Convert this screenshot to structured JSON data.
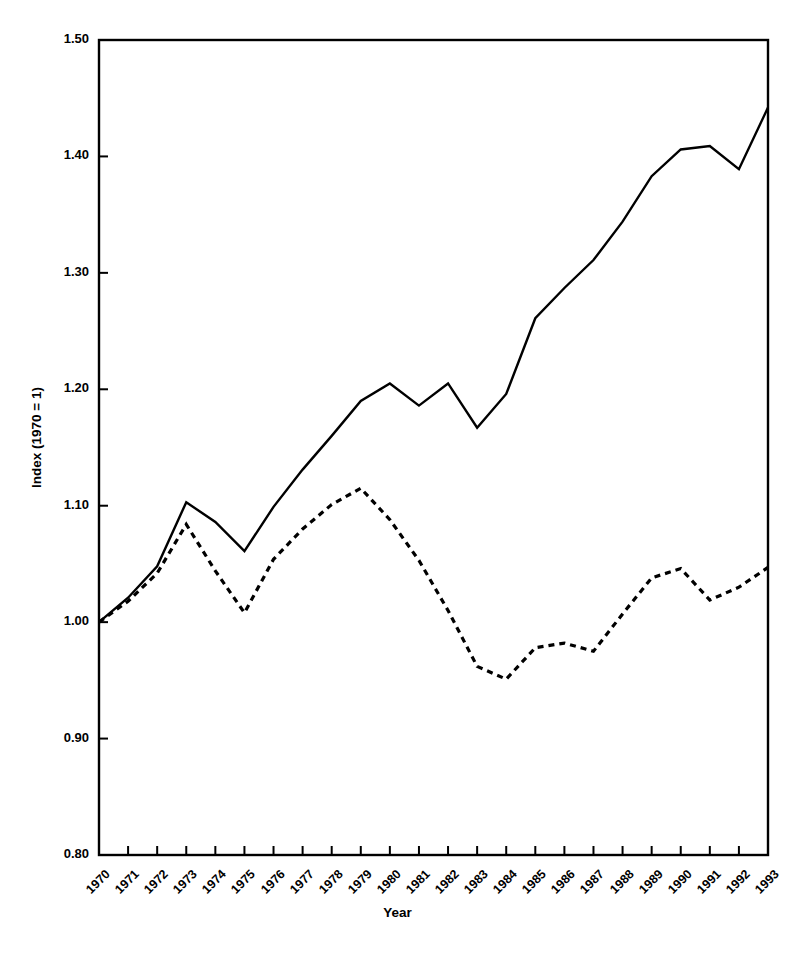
{
  "chart_data": {
    "type": "line",
    "title": "",
    "xlabel": "Year",
    "ylabel": "Index (1970 = 1)",
    "x": [
      1970,
      1971,
      1972,
      1973,
      1974,
      1975,
      1976,
      1977,
      1978,
      1979,
      1980,
      1981,
      1982,
      1983,
      1984,
      1985,
      1986,
      1987,
      1988,
      1989,
      1990,
      1991,
      1992,
      1993
    ],
    "xtick_labels": [
      "1970",
      "1971",
      "1972",
      "1973",
      "1974",
      "1975",
      "1976",
      "1977",
      "1978",
      "1979",
      "1980",
      "1981",
      "1982",
      "1983",
      "1984",
      "1985",
      "1986",
      "1987",
      "1988",
      "1989",
      "1990",
      "1991",
      "1992",
      "1993"
    ],
    "ytick_labels": [
      "0.80",
      "0.90",
      "1.00",
      "1.10",
      "1.20",
      "1.30",
      "1.40",
      "1.50"
    ],
    "ytick_values": [
      0.8,
      0.9,
      1.0,
      1.1,
      1.2,
      1.3,
      1.4,
      1.5
    ],
    "ylim": [
      0.8,
      1.5
    ],
    "xlim": [
      1970,
      1993
    ],
    "grid": false,
    "legend_position": "none",
    "series": [
      {
        "name": "solid-series",
        "style": "solid",
        "color": "#000000",
        "values": [
          1.0,
          1.021,
          1.048,
          1.103,
          1.086,
          1.061,
          1.099,
          1.131,
          1.16,
          1.19,
          1.205,
          1.186,
          1.205,
          1.167,
          1.196,
          1.261,
          1.287,
          1.311,
          1.344,
          1.383,
          1.406,
          1.409,
          1.389,
          1.442
        ]
      },
      {
        "name": "dashed-series",
        "style": "dashed",
        "color": "#000000",
        "values": [
          1.0,
          1.018,
          1.042,
          1.084,
          1.044,
          1.008,
          1.054,
          1.08,
          1.101,
          1.115,
          1.088,
          1.053,
          1.01,
          0.962,
          0.951,
          0.978,
          0.982,
          0.975,
          1.007,
          1.038,
          1.046,
          1.019,
          1.03,
          1.047
        ]
      }
    ]
  }
}
